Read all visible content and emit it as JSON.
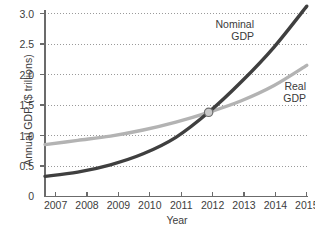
{
  "chart_data": {
    "type": "line",
    "title": "",
    "xlabel": "Year",
    "ylabel": "Annual GDP ($ trillions)",
    "x": [
      2007,
      2008,
      2009,
      2010,
      2011,
      2012,
      2013,
      2014,
      2015
    ],
    "xtick_labels": [
      "2007",
      "2008",
      "2009",
      "2010",
      "2011",
      "2012",
      "2013",
      "2014",
      "2015"
    ],
    "ytick_labels": [
      "0",
      "0.5",
      "1.0",
      "1.5",
      "2.0",
      "2.5",
      "3.0"
    ],
    "ytick_values": [
      0,
      0.5,
      1.0,
      1.5,
      2.0,
      2.5,
      3.0
    ],
    "xlim": [
      2006.7,
      2015.0
    ],
    "ylim": [
      0,
      3.25
    ],
    "grid": "horizontal-dotted",
    "legend": "inline-annotations",
    "series": [
      {
        "name": "Nominal GDP",
        "label_line1": "Nominal",
        "label_line2": "GDP",
        "color": "#3f3f3f",
        "values": [
          0.33,
          0.4,
          0.52,
          0.7,
          0.97,
          1.38,
          1.88,
          2.45,
          3.12
        ]
      },
      {
        "name": "Real GDP",
        "label_line1": "Real",
        "label_line2": "GDP",
        "color": "#b3b3b3",
        "values": [
          0.85,
          0.92,
          0.99,
          1.09,
          1.22,
          1.38,
          1.57,
          1.82,
          2.15
        ]
      }
    ],
    "annotations": [
      {
        "name": "intersection-marker",
        "x": 2012,
        "y": 1.38,
        "fill": "#c9c9c9",
        "stroke": "#6e6e6e"
      }
    ],
    "axis_color": "#6b6b6b",
    "grid_color": "#9a9a9a"
  }
}
